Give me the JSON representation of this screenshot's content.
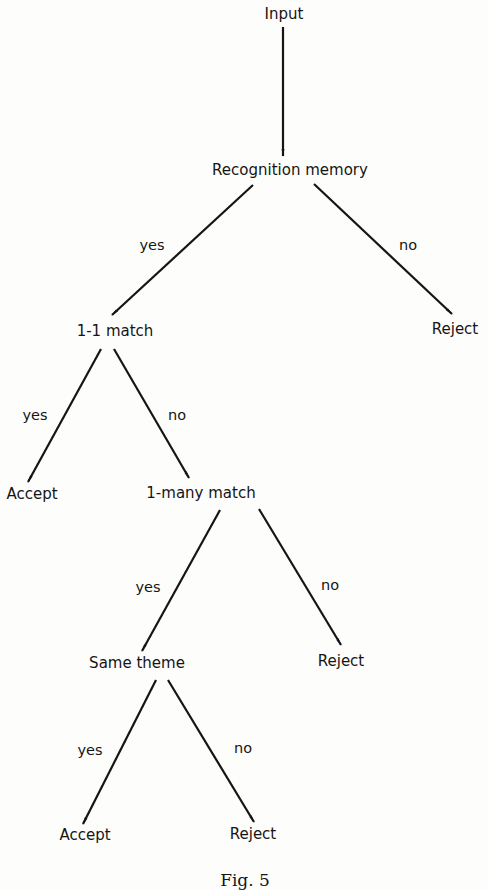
{
  "diagram": {
    "type": "decision-tree",
    "nodes": {
      "input": "Input",
      "recognition_memory": "Recognition memory",
      "one_one_match": "1-1 match",
      "reject_1": "Reject",
      "accept_1": "Accept",
      "one_many_match": "1-many match",
      "same_theme": "Same theme",
      "reject_2": "Reject",
      "accept_2": "Accept",
      "reject_3": "Reject"
    },
    "edges": [
      {
        "from": "input",
        "to": "recognition_memory",
        "label": ""
      },
      {
        "from": "recognition_memory",
        "to": "one_one_match",
        "label": "yes"
      },
      {
        "from": "recognition_memory",
        "to": "reject_1",
        "label": "no"
      },
      {
        "from": "one_one_match",
        "to": "accept_1",
        "label": "yes"
      },
      {
        "from": "one_one_match",
        "to": "one_many_match",
        "label": "no"
      },
      {
        "from": "one_many_match",
        "to": "same_theme",
        "label": "yes"
      },
      {
        "from": "one_many_match",
        "to": "reject_2",
        "label": "no"
      },
      {
        "from": "same_theme",
        "to": "accept_2",
        "label": "yes"
      },
      {
        "from": "same_theme",
        "to": "reject_3",
        "label": "no"
      }
    ],
    "edge_labels": {
      "rm_yes": "yes",
      "rm_no": "no",
      "om_yes": "yes",
      "om_no": "no",
      "mm_yes": "yes",
      "mm_no": "no",
      "st_yes": "yes",
      "st_no": "no"
    },
    "caption": "Fig. 5"
  },
  "colors": {
    "background": "#fdfdfb",
    "ink": "#151515"
  }
}
